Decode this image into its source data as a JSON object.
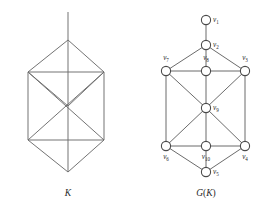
{
  "figure": {
    "left_panel": {
      "caption": "K",
      "name": "simplicial-complex-K",
      "description": "hexagonal bipyramid diagram with vertical axis line",
      "line_color": "#6b6b6b"
    },
    "right_panel": {
      "caption_prefix": "G",
      "caption_open": "(",
      "caption_inner": "K",
      "caption_close": ")",
      "caption_full": "G(K)",
      "name": "graph-G-of-K",
      "node_fill": "#ffffff",
      "node_stroke": "#4a4a4a",
      "edge_color": "#5a5a5a",
      "vertices": [
        {
          "id": "v1",
          "label_base": "v",
          "label_sub": "1",
          "cx": 206,
          "cy": 20,
          "r": 4.6,
          "label_x": 213,
          "label_y": 22,
          "label_anchor": "start"
        },
        {
          "id": "v2",
          "label_base": "v",
          "label_sub": "2",
          "cx": 206,
          "cy": 45,
          "r": 4.6,
          "label_x": 213,
          "label_y": 47,
          "label_anchor": "start"
        },
        {
          "id": "v7",
          "label_base": "v",
          "label_sub": "7",
          "cx": 166,
          "cy": 71,
          "r": 4.6,
          "label_x": 166,
          "label_y": 60,
          "label_anchor": "middle"
        },
        {
          "id": "v8",
          "label_base": "v",
          "label_sub": "8",
          "cx": 206,
          "cy": 71,
          "r": 4.6,
          "label_x": 206,
          "label_y": 60,
          "label_anchor": "middle"
        },
        {
          "id": "v3",
          "label_base": "v",
          "label_sub": "3",
          "cx": 245,
          "cy": 71,
          "r": 4.6,
          "label_x": 245,
          "label_y": 60,
          "label_anchor": "middle"
        },
        {
          "id": "v9",
          "label_base": "v",
          "label_sub": "9",
          "cx": 206,
          "cy": 108,
          "r": 4.6,
          "label_x": 213,
          "label_y": 110,
          "label_anchor": "start"
        },
        {
          "id": "v6",
          "label_base": "v",
          "label_sub": "6",
          "cx": 166,
          "cy": 146,
          "r": 4.6,
          "label_x": 166,
          "label_y": 159,
          "label_anchor": "middle"
        },
        {
          "id": "v10",
          "label_base": "v",
          "label_sub": "10",
          "cx": 206,
          "cy": 146,
          "r": 4.6,
          "label_x": 206,
          "label_y": 159,
          "label_anchor": "middle"
        },
        {
          "id": "v4",
          "label_base": "v",
          "label_sub": "4",
          "cx": 245,
          "cy": 146,
          "r": 4.6,
          "label_x": 245,
          "label_y": 159,
          "label_anchor": "middle"
        },
        {
          "id": "v5",
          "label_base": "v",
          "label_sub": "5",
          "cx": 206,
          "cy": 172,
          "r": 4.6,
          "label_x": 213,
          "label_y": 174,
          "label_anchor": "start"
        }
      ],
      "edges": [
        [
          "v1",
          "v2"
        ],
        [
          "v2",
          "v7"
        ],
        [
          "v2",
          "v8"
        ],
        [
          "v2",
          "v3"
        ],
        [
          "v7",
          "v8"
        ],
        [
          "v8",
          "v3"
        ],
        [
          "v7",
          "v6"
        ],
        [
          "v3",
          "v4"
        ],
        [
          "v7",
          "v9"
        ],
        [
          "v8",
          "v9"
        ],
        [
          "v3",
          "v9"
        ],
        [
          "v9",
          "v6"
        ],
        [
          "v9",
          "v10"
        ],
        [
          "v9",
          "v4"
        ],
        [
          "v6",
          "v10"
        ],
        [
          "v10",
          "v4"
        ],
        [
          "v6",
          "v5"
        ],
        [
          "v10",
          "v5"
        ],
        [
          "v4",
          "v5"
        ]
      ]
    },
    "left_geometry": {
      "apex_top": [
        68,
        40
      ],
      "apex_bottom": [
        68,
        172
      ],
      "left_upper": [
        28,
        72
      ],
      "right_upper": [
        104,
        72
      ],
      "left_lower": [
        28,
        140
      ],
      "right_lower": [
        104,
        140
      ],
      "axis_top": [
        68,
        12
      ],
      "center": [
        68,
        106
      ],
      "edges": [
        [
          68,
          12,
          68,
          172
        ],
        [
          68,
          40,
          28,
          72
        ],
        [
          68,
          40,
          104,
          72
        ],
        [
          28,
          72,
          104,
          72
        ],
        [
          28,
          72,
          28,
          140
        ],
        [
          104,
          72,
          104,
          140
        ],
        [
          28,
          140,
          104,
          140
        ],
        [
          28,
          72,
          104,
          140
        ],
        [
          104,
          72,
          28,
          140
        ],
        [
          28,
          140,
          68,
          172
        ],
        [
          104,
          140,
          68,
          172
        ],
        [
          28,
          72,
          68,
          106
        ],
        [
          104,
          72,
          68,
          106
        ]
      ]
    },
    "captions": {
      "left_x": 68,
      "left_y": 196,
      "right_x": 206,
      "right_y": 196
    }
  }
}
